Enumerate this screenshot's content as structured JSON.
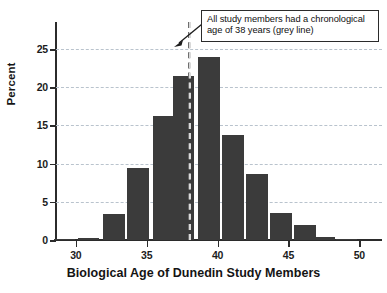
{
  "chart_data": {
    "type": "bar",
    "title": "",
    "xlabel": "Biological Age of Dunedin Study Members",
    "ylabel": "Percent",
    "xlim": [
      28.6,
      51.6
    ],
    "ylim": [
      0,
      27.5
    ],
    "grid": true,
    "legend_position": "none",
    "bar_color": "#3b3b3b",
    "gridline_color": "#b9c3cd",
    "axis_color": "#2b2b2b",
    "reference_line": {
      "value": 38,
      "color": "#d9d9d9",
      "style": "dashed",
      "label": "grey line"
    },
    "xticks": [
      30,
      35,
      40,
      45,
      50
    ],
    "xtick_labels": [
      "30",
      "35",
      "40",
      "45",
      "50"
    ],
    "yticks": [
      0,
      5,
      10,
      15,
      20,
      25
    ],
    "ytick_labels": [
      "0",
      "5",
      "10",
      "15",
      "20",
      "25"
    ],
    "bin_width": 1.75,
    "categories": [
      29.3,
      31.0,
      32.8,
      34.5,
      36.3,
      37.7,
      39.5,
      41.2,
      42.9,
      44.6,
      46.3,
      47.6,
      49.2
    ],
    "values": [
      0.1,
      0.3,
      3.4,
      9.4,
      16.2,
      21.5,
      24.0,
      13.8,
      8.6,
      3.6,
      2.0,
      0.35,
      0.1
    ],
    "annotations": [
      {
        "name": "chronological-age-note",
        "line1": "All study members had a chronological",
        "line2": "age of 38 years (grey line)",
        "points_to": 38
      }
    ]
  }
}
